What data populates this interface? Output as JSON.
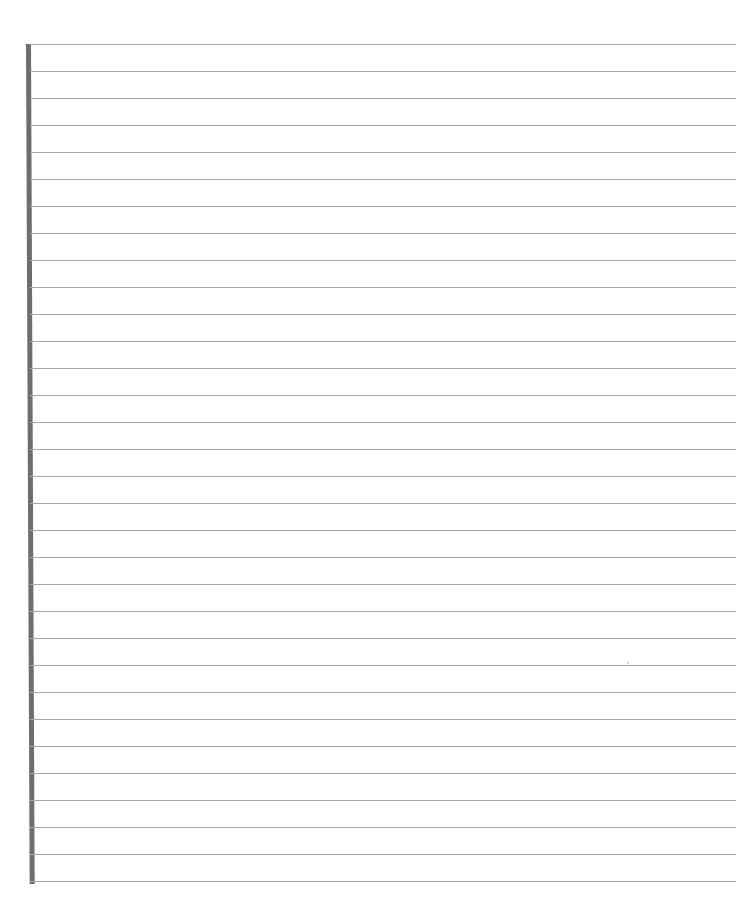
{
  "page": {
    "type": "blank lined paper",
    "line_count": 32,
    "first_line_y": 44,
    "line_spacing_px": 27,
    "line_color": "#a8a8a8",
    "margin_bar_color": "#6e6e6e",
    "background_color": "#ffffff"
  }
}
